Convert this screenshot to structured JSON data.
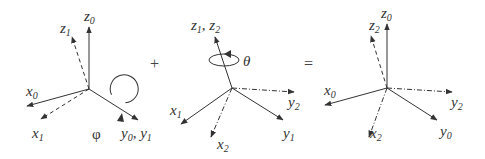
{
  "figure": {
    "colors": {
      "axis": "#333333",
      "background": "#ffffff"
    },
    "operators": {
      "plus": "+",
      "equals": "="
    },
    "panels": [
      {
        "id": "panel-1",
        "rotation": {
          "symbol": "φ",
          "about": "y0, y1"
        },
        "labels": {
          "z0": {
            "base": "z",
            "sub": "0"
          },
          "z1": {
            "base": "z",
            "sub": "1"
          },
          "x0": {
            "base": "x",
            "sub": "0"
          },
          "x1": {
            "base": "x",
            "sub": "1"
          },
          "y0y1": {
            "base": "y",
            "sub": "0",
            "sep": ", ",
            "base2": "y",
            "sub2": "1"
          },
          "phi": "φ"
        }
      },
      {
        "id": "panel-2",
        "rotation": {
          "symbol": "θ",
          "about": "z1, z2"
        },
        "labels": {
          "z1z2": {
            "base": "z",
            "sub": "1",
            "sep": ", ",
            "base2": "z",
            "sub2": "2"
          },
          "theta": "θ",
          "x1": {
            "base": "x",
            "sub": "1"
          },
          "x2": {
            "base": "x",
            "sub": "2"
          },
          "y1": {
            "base": "y",
            "sub": "1"
          },
          "y2": {
            "base": "y",
            "sub": "2"
          }
        }
      },
      {
        "id": "panel-3",
        "labels": {
          "z0": {
            "base": "z",
            "sub": "0"
          },
          "z2": {
            "base": "z",
            "sub": "2"
          },
          "x0": {
            "base": "x",
            "sub": "0"
          },
          "x2": {
            "base": "x",
            "sub": "2"
          },
          "y0": {
            "base": "y",
            "sub": "0"
          },
          "y2": {
            "base": "y",
            "sub": "2"
          }
        }
      }
    ]
  }
}
